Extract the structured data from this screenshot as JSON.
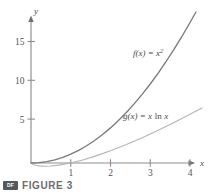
{
  "figure": {
    "caption_label": "FIGURE 3",
    "badge_text": "DF",
    "badge_icon": "media-badge-icon"
  },
  "chart_data": {
    "type": "line",
    "title": "",
    "xlabel": "x",
    "ylabel": "y",
    "xlim": [
      0,
      4.35
    ],
    "ylim": [
      -0.9,
      17.6
    ],
    "xticks": [
      1,
      2,
      3,
      4
    ],
    "yticks": [
      5,
      10,
      15
    ],
    "xtick_labels": [
      "1",
      "2",
      "3",
      "4"
    ],
    "ytick_labels": [
      "5",
      "10",
      "15"
    ],
    "grid": false,
    "legend": "inline-annotations",
    "series": [
      {
        "name": "f(x) = x^2",
        "annotation": "f(x) = x",
        "annotation_exponent": "2",
        "color": "#7a7a7e",
        "x": [
          0,
          0.2,
          0.4,
          0.6,
          0.8,
          1.0,
          1.2,
          1.4,
          1.6,
          1.8,
          2.0,
          2.2,
          2.4,
          2.6,
          2.8,
          3.0,
          3.2,
          3.4,
          3.6,
          3.8,
          4.0,
          4.15
        ],
        "values": [
          0,
          0.04,
          0.16,
          0.36,
          0.64,
          1.0,
          1.44,
          1.96,
          2.56,
          3.24,
          4.0,
          4.84,
          5.76,
          6.76,
          7.84,
          9.0,
          10.24,
          11.56,
          12.96,
          14.44,
          16.0,
          17.2
        ]
      },
      {
        "name": "g(x) = x ln x",
        "annotation": "g(x) = x",
        "annotation_operator": "ln",
        "annotation_variable": "x",
        "color": "#b4b4b8",
        "x": [
          0.02,
          0.1,
          0.2,
          0.3,
          0.368,
          0.5,
          0.7,
          1.0,
          1.3,
          1.6,
          2.0,
          2.4,
          2.8,
          3.2,
          3.6,
          4.0,
          4.3
        ],
        "values": [
          -0.078,
          -0.23,
          -0.322,
          -0.361,
          -0.368,
          -0.347,
          -0.25,
          0,
          0.341,
          0.752,
          1.386,
          2.101,
          2.882,
          3.722,
          4.611,
          5.545,
          6.274
        ]
      }
    ],
    "axis_arrows": [
      "x-positive",
      "y-positive"
    ]
  }
}
